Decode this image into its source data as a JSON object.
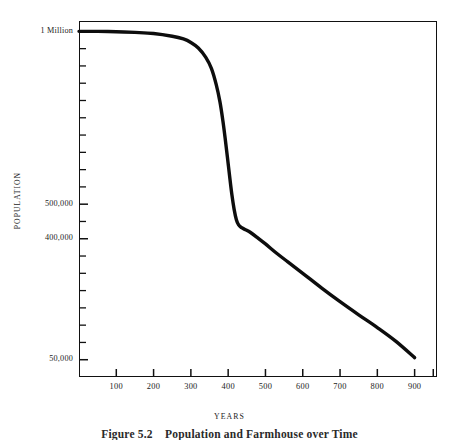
{
  "figure": {
    "caption_label": "Figure 5.2",
    "caption_text": "Population and Farmhouse over Time",
    "background": "#ffffff",
    "ink_color": "#111111"
  },
  "chart_data": {
    "type": "line",
    "title": "",
    "xlabel": "YEARS",
    "ylabel": "POPULATION",
    "xlim": [
      0,
      960
    ],
    "ylim": [
      0,
      1030000
    ],
    "grid": false,
    "legend": null,
    "y_tick_labels": [
      {
        "value": 1000000,
        "label": "1 Million"
      },
      {
        "value": 500000,
        "label": "500,000"
      },
      {
        "value": 400000,
        "label": "400,000"
      },
      {
        "value": 50000,
        "label": "50,000"
      }
    ],
    "y_minor_tick_values": [
      950000,
      900000,
      850000,
      800000,
      750000,
      700000,
      650000,
      600000,
      550000,
      450000,
      350000,
      300000,
      250000,
      200000,
      150000,
      100000
    ],
    "x_tick_labels": [
      "100",
      "200",
      "300",
      "400",
      "500",
      "600",
      "700",
      "800",
      "900"
    ],
    "x_tick_values": [
      100,
      200,
      300,
      400,
      500,
      600,
      700,
      800,
      900
    ],
    "x_minor_tick_values": [
      950
    ],
    "series": [
      {
        "name": "Population",
        "color": "#0d0d0d",
        "line_width": 3.4,
        "x": [
          0,
          50,
          100,
          150,
          200,
          250,
          280,
          300,
          320,
          340,
          355,
          368,
          378,
          386,
          392,
          398,
          404,
          410,
          416,
          422,
          428,
          436,
          445,
          460,
          480,
          500,
          530,
          560,
          600,
          650,
          700,
          750,
          800,
          850,
          900
        ],
        "y": [
          1000000,
          1000000,
          999000,
          997000,
          994000,
          986000,
          978000,
          968000,
          952000,
          925000,
          893000,
          846000,
          796000,
          740000,
          690000,
          636000,
          580000,
          527000,
          485000,
          455000,
          440000,
          432000,
          427000,
          418000,
          402000,
          385000,
          358000,
          333000,
          300000,
          258000,
          218000,
          180000,
          143000,
          103000,
          56000
        ]
      }
    ],
    "annotations": []
  }
}
